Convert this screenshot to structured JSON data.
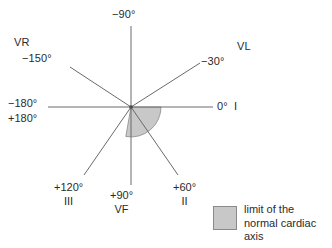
{
  "figure": {
    "center": {
      "x": 131,
      "y": 107
    },
    "line_color": "#555555",
    "wedge_fill": "#c8c8c8",
    "wedge_stroke": "#8a8a8a",
    "text_color": "#2b2b2b"
  },
  "axes": [
    {
      "id": "neg90",
      "degrees": "−90°",
      "lead": "",
      "angle": -90
    },
    {
      "id": "neg30",
      "degrees": "−30°",
      "lead": "VL",
      "angle": -30
    },
    {
      "id": "zero",
      "degrees": "0°",
      "lead": "I",
      "angle": 0
    },
    {
      "id": "pos60",
      "degrees": "+60°",
      "lead": "II",
      "angle": 60
    },
    {
      "id": "pos90",
      "degrees": "+90°",
      "lead": "VF",
      "angle": 90
    },
    {
      "id": "pos120",
      "degrees": "+120°",
      "lead": "III",
      "angle": 120
    },
    {
      "id": "neg180",
      "degrees": "−180°",
      "lead": "",
      "angle": 180
    },
    {
      "id": "pos180",
      "degrees": "+180°",
      "lead": "",
      "angle": 180
    },
    {
      "id": "neg150",
      "degrees": "−150°",
      "lead": "VR",
      "angle": -150
    }
  ],
  "labels": {
    "neg90": "−90°",
    "vr": "VR",
    "neg150": "−150°",
    "vl": "VL",
    "neg30": "−30°",
    "neg180": "−180°",
    "pos180": "+180°",
    "zero": "0°",
    "lead_I": "I",
    "pos120": "+120°",
    "lead_III": "III",
    "pos90": "+90°",
    "lead_VF": "VF",
    "pos60": "+60°",
    "lead_II": "II"
  },
  "shaded_region": {
    "name": "normal cardiac axis limit",
    "start_degrees": 0,
    "end_degrees": 100,
    "fill": "#c8c8c8"
  },
  "legend": {
    "swatch_color": "#c8c8c8",
    "line1": "limit of the",
    "line2": "normal cardiac",
    "line3": "axis"
  }
}
